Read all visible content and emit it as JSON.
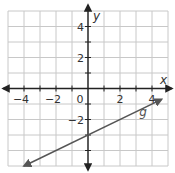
{
  "chart_data": {
    "type": "line",
    "title": "",
    "xlabel": "x",
    "ylabel": "y",
    "xlim": [
      -5,
      5
    ],
    "ylim": [
      -5,
      5
    ],
    "grid": true,
    "grid_step": 1,
    "x_ticks": [
      -4,
      -2,
      0,
      2,
      4
    ],
    "x_tick_labels": [
      "−4",
      "−2",
      "0",
      "2",
      "4"
    ],
    "y_ticks": [
      -2,
      2,
      4
    ],
    "y_tick_labels": [
      "−2",
      "2",
      "4"
    ],
    "origin_label": "0",
    "series": [
      {
        "name": "g",
        "equation": "y = 0.5x − 3",
        "slope": 0.5,
        "intercept": -3,
        "x": [
          -4,
          -2,
          0,
          2,
          4
        ],
        "values": [
          -5,
          -4,
          -3,
          -2,
          -1
        ],
        "arrows": "both",
        "start": [
          -4.0,
          -5.0
        ],
        "end": [
          4.6,
          -0.7
        ],
        "color": "#555555"
      }
    ],
    "legend": "none",
    "annotations": [
      {
        "text": "g",
        "x": 3.2,
        "y": -1.8
      }
    ]
  },
  "colors": {
    "grid": "#c8c8c8",
    "axis": "#222222",
    "line": "#555555",
    "background": "#ffffff"
  }
}
